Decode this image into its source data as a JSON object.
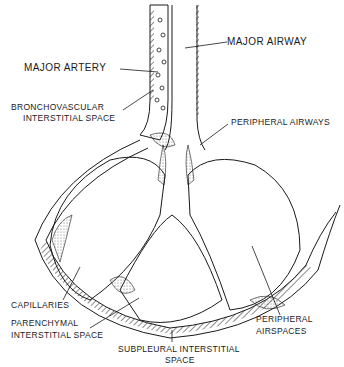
{
  "diagram": {
    "colors": {
      "ink": "#1a1a1a",
      "stipple": "#cfcfcf",
      "background": "#ffffff"
    },
    "labels": {
      "major_artery": "MAJOR ARTERY",
      "major_airway": "MAJOR AIRWAY",
      "bronchovascular_line1": "BRONCHOVASCULAR",
      "bronchovascular_line2": "INTERSTITIAL SPACE",
      "peripheral_airways": "PERIPHERAL AIRWAYS",
      "capillaries": "CAPILLARIES",
      "parenchymal_line1": "PARENCHYMAL",
      "parenchymal_line2": "INTERSTITIAL SPACE",
      "subpleural_line1": "SUBPLEURAL INTERSTITIAL",
      "subpleural_line2": "SPACE",
      "peripheral_airspaces_line1": "PERIPHERAL",
      "peripheral_airspaces_line2": "AIRSPACES"
    }
  }
}
